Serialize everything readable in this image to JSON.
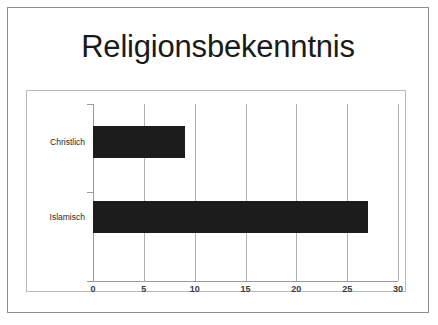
{
  "chart_data": {
    "type": "bar",
    "orientation": "horizontal",
    "title": "Religionsbekenntnis",
    "categories": [
      "Christlich",
      "Islamisch"
    ],
    "values": [
      9,
      27
    ],
    "series": [
      {
        "name": "Anzahl",
        "values": [
          9,
          27
        ]
      }
    ],
    "xlabel": "",
    "ylabel": "",
    "xlim": [
      0,
      30
    ],
    "xticks": [
      "0",
      "5",
      "10",
      "15",
      "20",
      "25",
      "30"
    ],
    "xtick_values": [
      0,
      5,
      10,
      15,
      20,
      25,
      30
    ],
    "grid": true,
    "legend": false,
    "bar_color": "#1c1c1c",
    "plot_border_color": "#b9b9b9",
    "axis_color": "#9a9a9a",
    "frame_color": "#8d8d8d",
    "background": "#ffffff"
  }
}
